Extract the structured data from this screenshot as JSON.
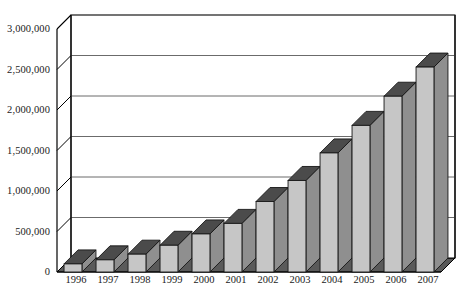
{
  "chart_data": {
    "type": "bar",
    "title": "",
    "subtitle": "",
    "xlabel": "",
    "ylabel": "",
    "categories": [
      "1996",
      "1997",
      "1998",
      "1999",
      "2000",
      "2001",
      "2002",
      "2003",
      "2004",
      "2005",
      "2006",
      "2007"
    ],
    "values": [
      100000,
      150000,
      220000,
      330000,
      470000,
      600000,
      870000,
      1130000,
      1470000,
      1810000,
      2170000,
      2530000
    ],
    "series": [
      {
        "name": "",
        "values": [
          100000,
          150000,
          220000,
          330000,
          470000,
          600000,
          870000,
          1130000,
          1470000,
          1810000,
          2170000,
          2530000
        ]
      }
    ],
    "ylim": [
      0,
      3000000
    ],
    "ytick_values": [
      0,
      500000,
      1000000,
      1500000,
      2000000,
      2500000,
      3000000
    ],
    "ytick_labels": [
      "0",
      "500,000",
      "1,000,000",
      "1,500,000",
      "2,000,000",
      "2,500,000",
      "3,000,000"
    ],
    "grid": true,
    "grid_axis": "y",
    "legend": false,
    "legend_position": "none",
    "annotations": [],
    "style": {
      "three_d": true,
      "bar_front_color": "#c6c6c6",
      "bar_top_color": "#4b4b4b",
      "bar_side_color": "#8f8f8f",
      "floor_color": "#5a5a5a",
      "wall_color": "#ffffff",
      "axis_line_color": "#000000",
      "grid_line_color": "#6b6b6b",
      "text_color": "#1a1a1a",
      "background_color": "#ffffff"
    }
  }
}
